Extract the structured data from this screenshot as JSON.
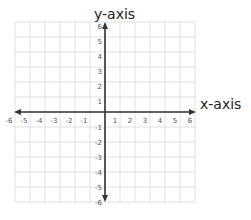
{
  "chart_data": {
    "type": "coordinate-plane",
    "title": "",
    "xlabel": "x-axis",
    "ylabel": "y-axis",
    "xlim": [
      -6,
      6
    ],
    "ylim": [
      -6,
      6
    ],
    "x_ticks": [
      -6,
      -5,
      -4,
      -3,
      -2,
      -1,
      1,
      2,
      3,
      4,
      5,
      6
    ],
    "y_ticks": [
      6,
      5,
      4,
      3,
      2,
      1,
      -1,
      -2,
      -3,
      -4,
      -5,
      -6
    ],
    "grid": true,
    "series": []
  },
  "labels": {
    "x_axis": "x-axis",
    "y_axis": "y-axis"
  },
  "colors": {
    "grid": "#d9d9d9",
    "axis": "#333333",
    "tick_text": "#555555",
    "label_text": "#222222"
  }
}
